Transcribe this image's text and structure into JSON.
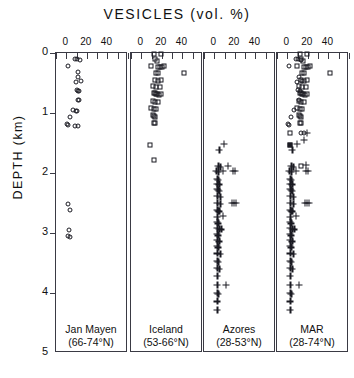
{
  "chart_data": {
    "type": "scatter",
    "title": "VESICLES  (vol. %)",
    "xlabel": "VESICLES (vol. %)",
    "ylabel": "DEPTH (km)",
    "xlim": [
      -10,
      60
    ],
    "ylim": [
      0,
      5
    ],
    "y_inverted": true,
    "grid": false,
    "legend": "none",
    "xticklabels": [
      "0",
      "20",
      "40"
    ],
    "xtickvalues": [
      0,
      20,
      40
    ],
    "x_minor_ticks": [
      -10,
      0,
      10,
      20,
      30,
      40,
      50,
      60
    ],
    "yticklabels": [
      "0",
      "1",
      "2",
      "3",
      "4",
      "5"
    ],
    "ytickvalues": [
      0,
      1,
      2,
      3,
      4,
      5
    ],
    "panels": [
      {
        "name": "Jan Mayen",
        "label_line1": "Jan Mayen",
        "label_line2": "(66-74°N)",
        "marker": "circle-open",
        "points": [
          {
            "x": 8,
            "y": 0.1
          },
          {
            "x": 10,
            "y": 0.1
          },
          {
            "x": 13,
            "y": 0.12
          },
          {
            "x": 2,
            "y": 0.22
          },
          {
            "x": 11,
            "y": 0.32
          },
          {
            "x": 11,
            "y": 0.4
          },
          {
            "x": 9,
            "y": 0.48
          },
          {
            "x": 14,
            "y": 0.47
          },
          {
            "x": 10,
            "y": 0.62
          },
          {
            "x": 11,
            "y": 0.63
          },
          {
            "x": 12,
            "y": 0.64
          },
          {
            "x": 11,
            "y": 0.78
          },
          {
            "x": 12,
            "y": 0.79
          },
          {
            "x": 7,
            "y": 0.95
          },
          {
            "x": 9,
            "y": 0.96
          },
          {
            "x": 10,
            "y": 0.97
          },
          {
            "x": 4,
            "y": 1.07
          },
          {
            "x": 1,
            "y": 1.18
          },
          {
            "x": 2,
            "y": 1.2
          },
          {
            "x": 8,
            "y": 1.22
          },
          {
            "x": 11,
            "y": 1.22
          },
          {
            "x": 2,
            "y": 2.52
          },
          {
            "x": 4,
            "y": 2.62
          },
          {
            "x": 3,
            "y": 2.95
          },
          {
            "x": 2,
            "y": 3.05
          },
          {
            "x": 4,
            "y": 3.06
          }
        ]
      },
      {
        "name": "Iceland",
        "label_line1": "Iceland",
        "label_line2": "(53-66°N)",
        "marker": "square-open",
        "points": [
          {
            "x": 12,
            "y": 0.02
          },
          {
            "x": 19,
            "y": 0.01
          },
          {
            "x": 13,
            "y": 0.1
          },
          {
            "x": 15,
            "y": 0.14
          },
          {
            "x": 9,
            "y": 0.22
          },
          {
            "x": 16,
            "y": 0.23
          },
          {
            "x": 18,
            "y": 0.23
          },
          {
            "x": 20,
            "y": 0.24
          },
          {
            "x": 22,
            "y": 0.22
          },
          {
            "x": 14,
            "y": 0.33
          },
          {
            "x": 16,
            "y": 0.34
          },
          {
            "x": 42,
            "y": 0.33
          },
          {
            "x": 13,
            "y": 0.45
          },
          {
            "x": 16,
            "y": 0.46
          },
          {
            "x": 19,
            "y": 0.45
          },
          {
            "x": 11,
            "y": 0.55
          },
          {
            "x": 14,
            "y": 0.56
          },
          {
            "x": 18,
            "y": 0.57
          },
          {
            "x": 12,
            "y": 0.66
          },
          {
            "x": 13,
            "y": 0.67
          },
          {
            "x": 14,
            "y": 0.68
          },
          {
            "x": 15,
            "y": 0.69
          },
          {
            "x": 17,
            "y": 0.7
          },
          {
            "x": 19,
            "y": 0.68
          },
          {
            "x": 11,
            "y": 0.8
          },
          {
            "x": 13,
            "y": 0.81
          },
          {
            "x": 16,
            "y": 0.82
          },
          {
            "x": 9,
            "y": 0.92
          },
          {
            "x": 12,
            "y": 0.93
          },
          {
            "x": 14,
            "y": 0.94
          },
          {
            "x": 11,
            "y": 1.03
          },
          {
            "x": 12,
            "y": 1.05
          },
          {
            "x": 13,
            "y": 1.06
          },
          {
            "x": 12,
            "y": 1.16
          },
          {
            "x": 13,
            "y": 1.17
          },
          {
            "x": 8,
            "y": 1.54
          },
          {
            "x": 12,
            "y": 1.78
          }
        ]
      },
      {
        "name": "Azores",
        "label_line1": "Azores",
        "label_line2": "(28-53°N)",
        "marker": "plus",
        "points": [
          {
            "x": 9,
            "y": 1.52
          },
          {
            "x": 5,
            "y": 1.62
          },
          {
            "x": 4,
            "y": 1.88
          },
          {
            "x": 6,
            "y": 1.9
          },
          {
            "x": 13,
            "y": 1.88
          },
          {
            "x": 2,
            "y": 1.97
          },
          {
            "x": 4,
            "y": 1.98
          },
          {
            "x": 8,
            "y": 1.97
          },
          {
            "x": 18,
            "y": 1.96
          },
          {
            "x": 20,
            "y": 1.97
          },
          {
            "x": 3,
            "y": 2.1
          },
          {
            "x": 4,
            "y": 2.12
          },
          {
            "x": 3,
            "y": 2.18
          },
          {
            "x": 5,
            "y": 2.19
          },
          {
            "x": 3,
            "y": 2.26
          },
          {
            "x": 4,
            "y": 2.28
          },
          {
            "x": 5,
            "y": 2.3
          },
          {
            "x": 3,
            "y": 2.38
          },
          {
            "x": 6,
            "y": 2.4
          },
          {
            "x": 3,
            "y": 2.5
          },
          {
            "x": 6,
            "y": 2.51
          },
          {
            "x": 17,
            "y": 2.5
          },
          {
            "x": 19,
            "y": 2.5
          },
          {
            "x": 21,
            "y": 2.5
          },
          {
            "x": 3,
            "y": 2.62
          },
          {
            "x": 4,
            "y": 2.63
          },
          {
            "x": 5,
            "y": 2.64
          },
          {
            "x": 3,
            "y": 2.73
          },
          {
            "x": 8,
            "y": 2.72
          },
          {
            "x": 3,
            "y": 2.82
          },
          {
            "x": 4,
            "y": 2.84
          },
          {
            "x": 3,
            "y": 2.92
          },
          {
            "x": 5,
            "y": 2.93
          },
          {
            "x": 7,
            "y": 2.94
          },
          {
            "x": 3,
            "y": 3.02
          },
          {
            "x": 4,
            "y": 3.04
          },
          {
            "x": 3,
            "y": 3.12
          },
          {
            "x": 5,
            "y": 3.14
          },
          {
            "x": 3,
            "y": 3.22
          },
          {
            "x": 4,
            "y": 3.24
          },
          {
            "x": 3,
            "y": 3.34
          },
          {
            "x": 6,
            "y": 3.35
          },
          {
            "x": 3,
            "y": 3.46
          },
          {
            "x": 4,
            "y": 3.48
          },
          {
            "x": 3,
            "y": 3.58
          },
          {
            "x": 5,
            "y": 3.6
          },
          {
            "x": 3,
            "y": 3.72
          },
          {
            "x": 3,
            "y": 3.86
          },
          {
            "x": 11,
            "y": 3.86
          },
          {
            "x": 3,
            "y": 4.0
          },
          {
            "x": 4,
            "y": 4.02
          },
          {
            "x": 3,
            "y": 4.14
          },
          {
            "x": 3,
            "y": 4.28
          }
        ]
      },
      {
        "name": "MAR",
        "label_line1": "MAR",
        "label_line2": "(28-74°N)",
        "marker": "mixed",
        "points": [
          {
            "x": 12,
            "y": 0.02,
            "m": "square-open"
          },
          {
            "x": 19,
            "y": 0.01,
            "m": "square-open"
          },
          {
            "x": 13,
            "y": 0.1,
            "m": "square-open"
          },
          {
            "x": 15,
            "y": 0.14,
            "m": "square-open"
          },
          {
            "x": 9,
            "y": 0.22,
            "m": "square-open"
          },
          {
            "x": 16,
            "y": 0.23,
            "m": "square-open"
          },
          {
            "x": 18,
            "y": 0.23,
            "m": "square-open"
          },
          {
            "x": 20,
            "y": 0.24,
            "m": "square-open"
          },
          {
            "x": 22,
            "y": 0.22,
            "m": "square-open"
          },
          {
            "x": 2,
            "y": 0.22,
            "m": "circle-open"
          },
          {
            "x": 14,
            "y": 0.33,
            "m": "square-open"
          },
          {
            "x": 16,
            "y": 0.34,
            "m": "square-open"
          },
          {
            "x": 42,
            "y": 0.33,
            "m": "square-open"
          },
          {
            "x": 8,
            "y": 0.1,
            "m": "circle-open"
          },
          {
            "x": 10,
            "y": 0.1,
            "m": "circle-open"
          },
          {
            "x": 13,
            "y": 0.12,
            "m": "circle-open"
          },
          {
            "x": 13,
            "y": 0.45,
            "m": "square-open"
          },
          {
            "x": 16,
            "y": 0.46,
            "m": "square-open"
          },
          {
            "x": 19,
            "y": 0.45,
            "m": "square-open"
          },
          {
            "x": 11,
            "y": 0.4,
            "m": "circle-open"
          },
          {
            "x": 11,
            "y": 0.55,
            "m": "square-open"
          },
          {
            "x": 14,
            "y": 0.56,
            "m": "square-open"
          },
          {
            "x": 18,
            "y": 0.57,
            "m": "square-open"
          },
          {
            "x": 9,
            "y": 0.48,
            "m": "circle-open"
          },
          {
            "x": 14,
            "y": 0.47,
            "m": "circle-open"
          },
          {
            "x": 12,
            "y": 0.66,
            "m": "square-open"
          },
          {
            "x": 13,
            "y": 0.67,
            "m": "square-open"
          },
          {
            "x": 14,
            "y": 0.68,
            "m": "square-open"
          },
          {
            "x": 15,
            "y": 0.69,
            "m": "square-open"
          },
          {
            "x": 17,
            "y": 0.7,
            "m": "square-open"
          },
          {
            "x": 19,
            "y": 0.68,
            "m": "square-open"
          },
          {
            "x": 10,
            "y": 0.62,
            "m": "circle-open"
          },
          {
            "x": 12,
            "y": 0.64,
            "m": "circle-open"
          },
          {
            "x": 11,
            "y": 0.8,
            "m": "square-open"
          },
          {
            "x": 13,
            "y": 0.81,
            "m": "square-open"
          },
          {
            "x": 16,
            "y": 0.82,
            "m": "square-open"
          },
          {
            "x": 11,
            "y": 0.78,
            "m": "circle-open"
          },
          {
            "x": 9,
            "y": 0.92,
            "m": "square-open"
          },
          {
            "x": 12,
            "y": 0.93,
            "m": "square-open"
          },
          {
            "x": 14,
            "y": 0.94,
            "m": "square-open"
          },
          {
            "x": 7,
            "y": 0.95,
            "m": "circle-open"
          },
          {
            "x": 11,
            "y": 1.03,
            "m": "square-open"
          },
          {
            "x": 12,
            "y": 1.05,
            "m": "square-open"
          },
          {
            "x": 13,
            "y": 1.06,
            "m": "square-open"
          },
          {
            "x": 4,
            "y": 1.07,
            "m": "circle-open"
          },
          {
            "x": 12,
            "y": 1.16,
            "m": "square-open"
          },
          {
            "x": 13,
            "y": 1.17,
            "m": "square-open"
          },
          {
            "x": 1,
            "y": 1.18,
            "m": "circle-open"
          },
          {
            "x": 2,
            "y": 1.2,
            "m": "circle-open"
          },
          {
            "x": 3,
            "y": 1.34,
            "m": "square-open"
          },
          {
            "x": 13,
            "y": 1.34,
            "m": "circle-open"
          },
          {
            "x": 16,
            "y": 1.34,
            "m": "circle-open"
          },
          {
            "x": 19,
            "y": 1.33,
            "m": "plus"
          },
          {
            "x": 16,
            "y": 1.45,
            "m": "plus"
          },
          {
            "x": 3,
            "y": 1.54,
            "m": "square-filled"
          },
          {
            "x": 9,
            "y": 1.52,
            "m": "plus"
          },
          {
            "x": 5,
            "y": 1.62,
            "m": "plus"
          },
          {
            "x": 4,
            "y": 1.88,
            "m": "plus"
          },
          {
            "x": 6,
            "y": 1.9,
            "m": "plus"
          },
          {
            "x": 13,
            "y": 1.88,
            "m": "square-open"
          },
          {
            "x": 18,
            "y": 1.87,
            "m": "plus"
          },
          {
            "x": 2,
            "y": 1.97,
            "m": "plus"
          },
          {
            "x": 4,
            "y": 1.98,
            "m": "plus"
          },
          {
            "x": 8,
            "y": 1.97,
            "m": "plus"
          },
          {
            "x": 18,
            "y": 1.96,
            "m": "plus"
          },
          {
            "x": 20,
            "y": 1.97,
            "m": "plus"
          },
          {
            "x": 3,
            "y": 2.1,
            "m": "plus"
          },
          {
            "x": 4,
            "y": 2.12,
            "m": "plus"
          },
          {
            "x": 3,
            "y": 2.18,
            "m": "plus"
          },
          {
            "x": 5,
            "y": 2.19,
            "m": "plus"
          },
          {
            "x": 3,
            "y": 2.26,
            "m": "plus"
          },
          {
            "x": 4,
            "y": 2.28,
            "m": "plus"
          },
          {
            "x": 5,
            "y": 2.3,
            "m": "plus"
          },
          {
            "x": 3,
            "y": 2.38,
            "m": "plus"
          },
          {
            "x": 6,
            "y": 2.4,
            "m": "plus"
          },
          {
            "x": 3,
            "y": 2.5,
            "m": "plus"
          },
          {
            "x": 6,
            "y": 2.51,
            "m": "plus"
          },
          {
            "x": 17,
            "y": 2.5,
            "m": "plus"
          },
          {
            "x": 19,
            "y": 2.5,
            "m": "plus"
          },
          {
            "x": 21,
            "y": 2.5,
            "m": "plus"
          },
          {
            "x": 3,
            "y": 2.62,
            "m": "plus"
          },
          {
            "x": 4,
            "y": 2.63,
            "m": "plus"
          },
          {
            "x": 5,
            "y": 2.64,
            "m": "plus"
          },
          {
            "x": 3,
            "y": 2.73,
            "m": "plus"
          },
          {
            "x": 8,
            "y": 2.72,
            "m": "plus"
          },
          {
            "x": 3,
            "y": 2.82,
            "m": "plus"
          },
          {
            "x": 4,
            "y": 2.84,
            "m": "plus"
          },
          {
            "x": 3,
            "y": 2.92,
            "m": "plus"
          },
          {
            "x": 5,
            "y": 2.93,
            "m": "plus"
          },
          {
            "x": 7,
            "y": 2.94,
            "m": "plus"
          },
          {
            "x": 3,
            "y": 3.02,
            "m": "plus"
          },
          {
            "x": 4,
            "y": 3.04,
            "m": "plus"
          },
          {
            "x": 3,
            "y": 3.12,
            "m": "plus"
          },
          {
            "x": 5,
            "y": 3.14,
            "m": "plus"
          },
          {
            "x": 3,
            "y": 3.22,
            "m": "plus"
          },
          {
            "x": 4,
            "y": 3.24,
            "m": "plus"
          },
          {
            "x": 3,
            "y": 3.34,
            "m": "plus"
          },
          {
            "x": 6,
            "y": 3.35,
            "m": "plus"
          },
          {
            "x": 3,
            "y": 3.46,
            "m": "plus"
          },
          {
            "x": 4,
            "y": 3.48,
            "m": "plus"
          },
          {
            "x": 3,
            "y": 3.58,
            "m": "plus"
          },
          {
            "x": 5,
            "y": 3.6,
            "m": "plus"
          },
          {
            "x": 3,
            "y": 3.72,
            "m": "plus"
          },
          {
            "x": 3,
            "y": 3.86,
            "m": "plus"
          },
          {
            "x": 11,
            "y": 3.86,
            "m": "plus"
          },
          {
            "x": 3,
            "y": 4.0,
            "m": "plus"
          },
          {
            "x": 4,
            "y": 4.02,
            "m": "plus"
          },
          {
            "x": 3,
            "y": 4.14,
            "m": "plus"
          },
          {
            "x": 3,
            "y": 4.28,
            "m": "plus"
          }
        ]
      }
    ]
  }
}
